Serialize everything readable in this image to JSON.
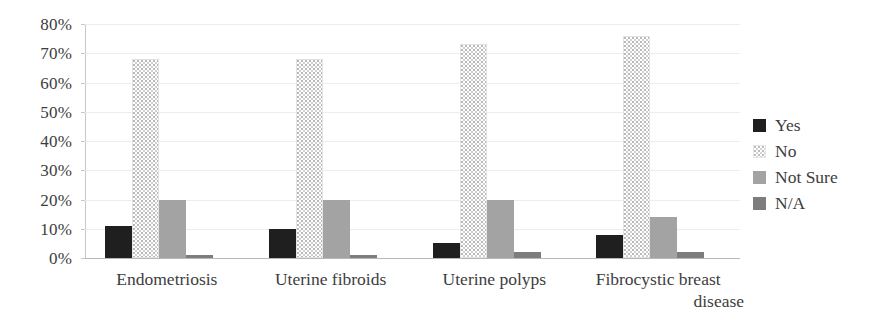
{
  "chart_data": {
    "type": "bar",
    "title": "",
    "subtitle": "",
    "xlabel": "",
    "ylabel": "",
    "ylim": [
      0,
      80
    ],
    "ytick_labels": [
      "80%",
      "70%",
      "60%",
      "50%",
      "40%",
      "30%",
      "20%",
      "10%",
      "0%"
    ],
    "ytick_values": [
      80,
      70,
      60,
      50,
      40,
      30,
      20,
      10,
      0
    ],
    "grid": true,
    "grid_axis": "y",
    "legend_position": "right",
    "categories": [
      "Endometriosis",
      "Uterine fibroids",
      "Uterine polyps",
      "Fibrocystic breast disease"
    ],
    "category_lines": [
      [
        "Endometriosis"
      ],
      [
        "Uterine fibroids"
      ],
      [
        "Uterine polyps"
      ],
      [
        "Fibrocystic breast",
        "disease"
      ]
    ],
    "series": [
      {
        "name": "Yes",
        "color": "#1f1f1f",
        "values": [
          11,
          10,
          5,
          8
        ]
      },
      {
        "name": "No",
        "color": "#ffffff",
        "values": [
          68,
          68,
          73,
          76
        ]
      },
      {
        "name": "Not Sure",
        "color": "#a3a3a3",
        "values": [
          20,
          20,
          20,
          14
        ]
      },
      {
        "name": "N/A",
        "color": "#7d7d7d",
        "values": [
          1,
          1,
          2,
          2
        ]
      }
    ]
  },
  "legend": {
    "items": [
      {
        "label": "Yes"
      },
      {
        "label": "No"
      },
      {
        "label": "Not Sure"
      },
      {
        "label": "N/A"
      }
    ]
  }
}
